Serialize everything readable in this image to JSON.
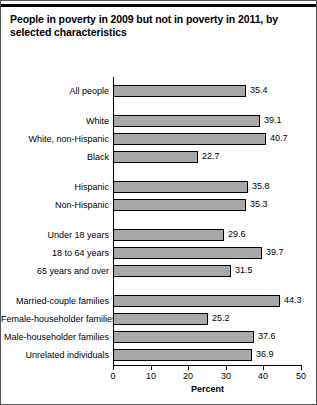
{
  "chart_data": {
    "type": "bar",
    "orientation": "horizontal",
    "title": "People in poverty in 2009 but not in poverty in 2011, by selected characteristics",
    "xlabel": "Percent",
    "ylabel": "",
    "xlim": [
      0,
      50
    ],
    "xticks": [
      0,
      10,
      20,
      30,
      40,
      50
    ],
    "xtick_labels": [
      "0",
      "10",
      "20",
      "30",
      "40",
      "50"
    ],
    "grid": false,
    "legend": null,
    "categories": [
      "All people",
      "White",
      "White, non-Hispanic",
      "Black",
      "Hispanic",
      "Non-Hispanic",
      "Under 18 years",
      "18 to 64 years",
      "65 years and over",
      "Married-couple families",
      "Female-householder families",
      "Male-householder families",
      "Unrelated individuals"
    ],
    "values": [
      35.4,
      39.1,
      40.7,
      22.7,
      35.8,
      35.3,
      29.6,
      39.7,
      31.5,
      44.3,
      25.2,
      37.6,
      36.9
    ],
    "value_labels": [
      "35.4",
      "39.1",
      "40.7",
      "22.7",
      "35.8",
      "35.3",
      "29.6",
      "39.7",
      "31.5",
      "44.3",
      "25.2",
      "37.6",
      "36.9"
    ],
    "groups": [
      {
        "name": "total",
        "indices": [
          0
        ]
      },
      {
        "name": "race",
        "indices": [
          1,
          2,
          3
        ]
      },
      {
        "name": "ethnicity",
        "indices": [
          4,
          5
        ]
      },
      {
        "name": "age",
        "indices": [
          6,
          7,
          8
        ]
      },
      {
        "name": "family-type",
        "indices": [
          9,
          10,
          11,
          12
        ]
      }
    ],
    "colors": {
      "bar_fill": "#a9a9a9",
      "bar_stroke": "#000000",
      "axis": "#000000",
      "text": "#000000",
      "background": "#ffffff",
      "frame": "#555555"
    }
  }
}
